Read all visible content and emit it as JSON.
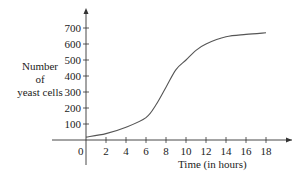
{
  "chart_data": {
    "type": "line",
    "title": "",
    "xlabel": "Time (in hours)",
    "ylabel": "Number of yeast cells",
    "ylabel_lines": [
      "Number",
      "of",
      "yeast cells"
    ],
    "origin_label": "0",
    "x_ticks": [
      2,
      4,
      6,
      8,
      10,
      12,
      14,
      16,
      18
    ],
    "y_ticks": [
      100,
      200,
      300,
      400,
      500,
      600,
      700
    ],
    "xlim": [
      0,
      20
    ],
    "ylim": [
      0,
      750
    ],
    "grid": false,
    "legend": null,
    "series": [
      {
        "name": "yeast population",
        "x": [
          0,
          2,
          4,
          6,
          7,
          8,
          9,
          10,
          11,
          12,
          14,
          16,
          18
        ],
        "y": [
          18,
          40,
          80,
          140,
          220,
          330,
          440,
          500,
          560,
          600,
          645,
          660,
          670
        ]
      }
    ],
    "color": "#555555"
  }
}
